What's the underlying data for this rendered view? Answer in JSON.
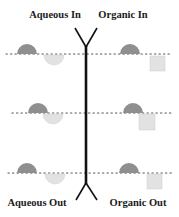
{
  "labels": {
    "top_left": "Aqueous In",
    "top_right": "Organic In",
    "bottom_left": "Aqueous Out",
    "bottom_right": "Organic Out"
  },
  "colors": {
    "background": "#ffffff",
    "line": "#111111",
    "dark_semicircle": "#8f8f8f",
    "light_semicircle": "#e2e2e2",
    "light_square": "#e2e2e2",
    "dotted_line": "#555555"
  },
  "rows": [
    {
      "interface_y": 54,
      "left": {
        "dark_cap_cx": 27,
        "light_bowl_cx": 54
      },
      "right": {
        "dark_cap_cx": 130,
        "square_x": 150
      }
    },
    {
      "interface_y": 113,
      "left": {
        "dark_cap_cx": 38,
        "light_bowl_cx": 53
      },
      "right": {
        "dark_cap_cx": 133,
        "square_x": 139
      }
    },
    {
      "interface_y": 173,
      "left": {
        "dark_cap_cx": 27,
        "light_bowl_cx": 55
      },
      "right": {
        "dark_cap_cx": 129,
        "square_x": 147
      }
    }
  ]
}
